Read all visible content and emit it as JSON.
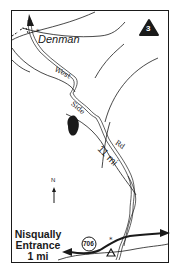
{
  "map": {
    "route_number": "3",
    "place_label": "Denman",
    "road_words": [
      "West",
      "Side",
      "Rd"
    ],
    "distance_label": "11 mi",
    "highway_number": "706",
    "destination": {
      "line1": "Nisqually",
      "line2": "Entrance",
      "line3": "1 mi"
    },
    "north_label": "N",
    "colors": {
      "ink": "#1a1a1a",
      "background": "#ffffff"
    },
    "icons": [
      "peak-icon",
      "trailhead-star-icon",
      "campground-triangle-icon",
      "lake-icon",
      "north-arrow-icon",
      "route-badge-icon",
      "highway-shield-icon"
    ]
  }
}
